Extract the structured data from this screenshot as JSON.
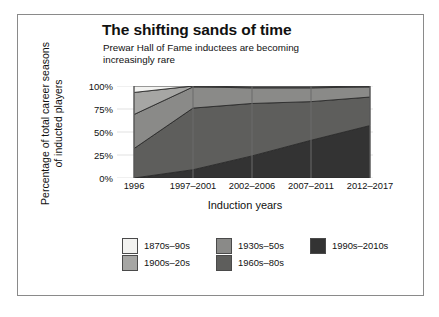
{
  "figure": {
    "title": "The shifting sands of time",
    "subtitle": "Prewar Hall of Fame inductees are becoming increasingly rare",
    "ylabel": "Percentage of total career seasons\nof inducted players",
    "xlabel": "Induction years"
  },
  "axes": {
    "y_ticks": [
      "100%",
      "75%",
      "50%",
      "25%",
      "0%"
    ],
    "x_ticks": [
      "1996",
      "1997–2001",
      "2002–2006",
      "2007–2011",
      "2012–2017"
    ]
  },
  "legend": {
    "columns": [
      [
        {
          "label": "1870s–90s",
          "color": "#f2f2f0"
        },
        {
          "label": "1900s–20s",
          "color": "#a6a6a4"
        }
      ],
      [
        {
          "label": "1930s–50s",
          "color": "#8a8a88"
        },
        {
          "label": "1960s–80s",
          "color": "#5e5e5c"
        }
      ],
      [
        {
          "label": "1990s–2010s",
          "color": "#333333"
        }
      ]
    ]
  },
  "chart_data": {
    "type": "area",
    "title": "The shifting sands of time",
    "subtitle": "Prewar Hall of Fame inductees are becoming increasingly rare",
    "xlabel": "Induction years",
    "ylabel": "Percentage of total career seasons of inducted players",
    "stacked": true,
    "normalized": true,
    "ylim": [
      0,
      100
    ],
    "grid": true,
    "legend_position": "bottom",
    "categories": [
      "1996",
      "1997–2001",
      "2002–2006",
      "2007–2011",
      "2012–2017"
    ],
    "series": [
      {
        "name": "1990s–2010s",
        "color": "#333333",
        "values": [
          0,
          9,
          24,
          41,
          57
        ]
      },
      {
        "name": "1960s–80s",
        "color": "#5e5e5c",
        "values": [
          32,
          67,
          57,
          42,
          31
        ]
      },
      {
        "name": "1930s–50s",
        "color": "#8a8a88",
        "values": [
          37,
          23,
          17,
          15,
          11
        ]
      },
      {
        "name": "1900s–20s",
        "color": "#a6a6a4",
        "values": [
          24,
          1,
          1,
          1,
          1
        ]
      },
      {
        "name": "1870s–90s",
        "color": "#f2f2f0",
        "values": [
          7,
          0,
          1,
          1,
          0
        ]
      }
    ],
    "cumulative_tops": {
      "1990s–2010s": [
        0,
        9,
        24,
        41,
        57
      ],
      "1960s–80s": [
        32,
        76,
        81,
        83,
        88
      ],
      "1930s–50s": [
        69,
        99,
        98,
        98,
        99
      ],
      "1900s–20s": [
        93,
        100,
        99,
        99,
        100
      ],
      "1870s–90s": [
        100,
        100,
        100,
        100,
        100
      ]
    }
  }
}
